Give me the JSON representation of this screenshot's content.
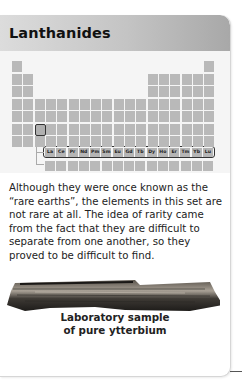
{
  "card": {
    "title": "Lanthanides",
    "body": "Although they were once known as the “rare earths”, the elements in this set are not rare at all. The idea of rarity came from the fact that they are difficult to separate from one another, so they proved to be difficult to find.",
    "image_caption_line1": "Laboratory sample",
    "image_caption_line2": "of pure ytterbium",
    "image_subject": "ytterbium-sample-photo"
  },
  "periodic_table": {
    "highlighted_group": "Lanthanides",
    "lanthanides": [
      "La",
      "Ce",
      "Pr",
      "Nd",
      "Pm",
      "Sm",
      "Eu",
      "Gd",
      "Tb",
      "Dy",
      "Ho",
      "Er",
      "Tm",
      "Yb",
      "Lu"
    ],
    "cell_color": "#b9b9b9",
    "highlight_border_color": "#333333"
  }
}
